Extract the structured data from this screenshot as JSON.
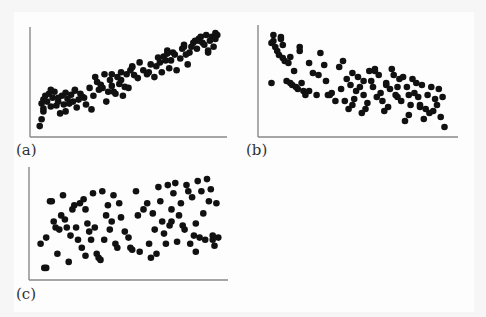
{
  "figure": {
    "background": "#f6f6f6",
    "dot_color": "#111111",
    "axis_color": "#888888"
  },
  "chart_data": [
    {
      "type": "scatter",
      "label": "(a)",
      "title": "",
      "xlabel": "",
      "ylabel": "",
      "xlim": [
        0,
        100
      ],
      "ylim": [
        0,
        100
      ],
      "grid": false,
      "legend": null,
      "description": "strong positive correlation",
      "x": [
        2,
        3,
        3,
        4,
        4,
        5,
        6,
        7,
        8,
        9,
        10,
        11,
        12,
        13,
        14,
        15,
        16,
        17,
        18,
        19,
        20,
        21,
        22,
        23,
        24,
        25,
        27,
        29,
        30,
        31,
        33,
        34,
        35,
        37,
        38,
        39,
        40,
        41,
        42,
        43,
        44,
        45,
        46,
        47,
        48,
        49,
        50,
        51,
        52,
        53,
        55,
        56,
        58,
        60,
        62,
        64,
        65,
        66,
        67,
        68,
        69,
        70,
        71,
        72,
        73,
        74,
        75,
        76,
        78,
        79,
        80,
        81,
        82,
        83,
        84,
        85,
        86,
        87,
        88,
        89,
        90,
        91,
        92,
        93,
        94,
        95,
        96,
        97,
        97,
        98,
        4,
        8,
        12,
        16,
        21,
        26,
        32,
        36,
        41,
        46,
        52,
        61,
        71,
        80,
        88,
        93
      ],
      "y": [
        5,
        12,
        28,
        20,
        32,
        36,
        30,
        38,
        25,
        34,
        40,
        26,
        30,
        18,
        36,
        27,
        39,
        33,
        28,
        37,
        30,
        41,
        24,
        32,
        38,
        35,
        27,
        44,
        22,
        36,
        50,
        42,
        47,
        58,
        30,
        40,
        52,
        46,
        40,
        38,
        55,
        48,
        60,
        36,
        45,
        58,
        44,
        62,
        65,
        57,
        54,
        70,
        62,
        58,
        68,
        55,
        66,
        75,
        70,
        60,
        76,
        72,
        82,
        64,
        72,
        80,
        78,
        62,
        74,
        84,
        88,
        78,
        68,
        80,
        86,
        90,
        92,
        84,
        94,
        96,
        90,
        88,
        98,
        80,
        92,
        96,
        86,
        100,
        94,
        98,
        23,
        42,
        34,
        20,
        42,
        34,
        55,
        44,
        58,
        52,
        66,
        60,
        79,
        86,
        92,
        82
      ]
    },
    {
      "type": "scatter",
      "label": "(b)",
      "title": "",
      "xlabel": "",
      "ylabel": "",
      "xlim": [
        0,
        100
      ],
      "ylim": [
        0,
        100
      ],
      "grid": false,
      "legend": null,
      "description": "moderate negative correlation",
      "x": [
        4,
        5,
        5,
        6,
        7,
        8,
        9,
        10,
        10,
        11,
        12,
        13,
        14,
        15,
        16,
        17,
        18,
        19,
        20,
        21,
        22,
        24,
        26,
        28,
        30,
        32,
        33,
        34,
        36,
        38,
        40,
        42,
        43,
        44,
        45,
        46,
        47,
        48,
        49,
        50,
        51,
        52,
        53,
        54,
        55,
        56,
        57,
        58,
        59,
        60,
        61,
        62,
        63,
        64,
        65,
        66,
        67,
        68,
        69,
        70,
        71,
        72,
        73,
        74,
        75,
        76,
        77,
        78,
        79,
        80,
        81,
        82,
        83,
        84,
        85,
        86,
        87,
        88,
        89,
        90,
        91,
        92,
        93,
        94,
        95,
        96,
        4,
        9,
        14,
        19,
        24,
        29,
        35,
        41,
        47,
        53,
        59,
        65,
        71,
        77,
        83
      ],
      "y": [
        48,
        96,
        90,
        84,
        80,
        76,
        94,
        73,
        86,
        70,
        50,
        68,
        48,
        46,
        60,
        44,
        42,
        80,
        48,
        40,
        36,
        40,
        58,
        36,
        78,
        66,
        50,
        36,
        38,
        30,
        64,
        70,
        30,
        52,
        22,
        46,
        26,
        32,
        40,
        54,
        44,
        18,
        36,
        22,
        28,
        60,
        50,
        44,
        60,
        34,
        56,
        38,
        30,
        20,
        48,
        24,
        42,
        62,
        56,
        36,
        44,
        52,
        30,
        54,
        10,
        44,
        36,
        26,
        52,
        38,
        48,
        34,
        24,
        46,
        12,
        22,
        36,
        18,
        44,
        20,
        32,
        26,
        42,
        14,
        34,
        4,
        88,
        92,
        74,
        84,
        68,
        56,
        36,
        42,
        58,
        50,
        62,
        46,
        34,
        16,
        26
      ]
    },
    {
      "type": "scatter",
      "label": "(c)",
      "title": "",
      "xlabel": "",
      "ylabel": "",
      "xlim": [
        0,
        100
      ],
      "ylim": [
        0,
        100
      ],
      "grid": false,
      "legend": null,
      "description": "no apparent correlation",
      "x": [
        3,
        5,
        6,
        8,
        9,
        10,
        11,
        12,
        13,
        14,
        15,
        16,
        18,
        19,
        20,
        21,
        22,
        23,
        24,
        25,
        26,
        27,
        28,
        29,
        30,
        31,
        32,
        33,
        34,
        35,
        36,
        37,
        38,
        40,
        41,
        42,
        43,
        44,
        45,
        46,
        48,
        50,
        52,
        54,
        55,
        56,
        58,
        60,
        62,
        63,
        64,
        65,
        66,
        67,
        68,
        69,
        70,
        71,
        72,
        73,
        74,
        75,
        76,
        77,
        78,
        79,
        80,
        81,
        82,
        83,
        84,
        85,
        86,
        87,
        88,
        89,
        90,
        91,
        92,
        93,
        94,
        95,
        96,
        97,
        98,
        6,
        17,
        27,
        39,
        51,
        61,
        73,
        86,
        95
      ],
      "y": [
        30,
        6,
        6,
        72,
        72,
        52,
        46,
        20,
        44,
        58,
        78,
        54,
        12,
        38,
        64,
        68,
        46,
        34,
        70,
        26,
        74,
        18,
        50,
        42,
        34,
        80,
        46,
        20,
        16,
        14,
        82,
        34,
        58,
        44,
        52,
        78,
        30,
        26,
        70,
        56,
        42,
        36,
        24,
        82,
        58,
        22,
        64,
        70,
        16,
        60,
        44,
        20,
        86,
        72,
        52,
        40,
        30,
        88,
        48,
        64,
        80,
        90,
        32,
        58,
        70,
        48,
        44,
        88,
        82,
        30,
        76,
        38,
        50,
        92,
        36,
        82,
        60,
        34,
        94,
        72,
        84,
        38,
        28,
        70,
        36,
        36,
        46,
        64,
        68,
        26,
        30,
        52,
        22,
        34
      ]
    }
  ],
  "panels": {
    "a": {
      "label": "(a)"
    },
    "b": {
      "label": "(b)"
    },
    "c": {
      "label": "(c)"
    }
  }
}
